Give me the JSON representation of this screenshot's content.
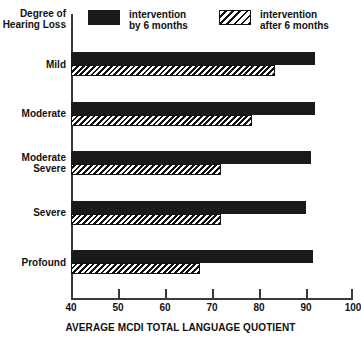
{
  "chart_data": {
    "type": "bar",
    "orientation": "horizontal",
    "title": "",
    "xlabel": "AVERAGE MCDI TOTAL LANGUAGE QUOTIENT",
    "ylabel": "Degree of Hearing Loss",
    "xlim": [
      40,
      100
    ],
    "xticks": [
      40,
      50,
      60,
      70,
      80,
      90,
      100
    ],
    "grid": false,
    "legend_position": "top",
    "categories": [
      "Mild",
      "Moderate",
      "Moderate Severe",
      "Severe",
      "Profound"
    ],
    "series": [
      {
        "name": "intervention by 6 months",
        "pattern": "solid",
        "color": "#1a1a1a",
        "values": [
          92,
          92,
          91,
          90,
          91.5
        ]
      },
      {
        "name": "intervention after 6 months",
        "pattern": "diagonal-hatch",
        "color": "#111111",
        "values": [
          83.5,
          78.5,
          72,
          72,
          67.5
        ]
      }
    ]
  },
  "legend": {
    "entries": [
      {
        "line1": "intervention",
        "line2": "by 6 months",
        "swatch": "solid-swatch"
      },
      {
        "line1": "intervention",
        "line2": "after 6 months",
        "swatch": "hatch-swatch"
      }
    ]
  },
  "axes": {
    "y_title_line1": "Degree of",
    "y_title_line2": "Hearing Loss",
    "x_title": "AVERAGE MCDI TOTAL LANGUAGE QUOTIENT",
    "x_tick_labels": [
      "40",
      "50",
      "60",
      "70",
      "80",
      "90",
      "100"
    ]
  },
  "category_labels": [
    {
      "line1": "Mild",
      "line2": ""
    },
    {
      "line1": "Moderate",
      "line2": ""
    },
    {
      "line1": "Moderate",
      "line2": "Severe"
    },
    {
      "line1": "Severe",
      "line2": ""
    },
    {
      "line1": "Profound",
      "line2": ""
    }
  ]
}
